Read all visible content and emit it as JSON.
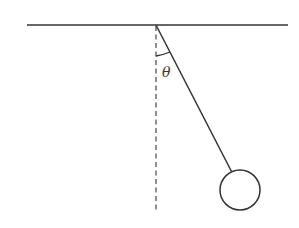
{
  "diagram": {
    "type": "simple-pendulum",
    "angle_label": "θ",
    "colors": {
      "line": "#333333",
      "background": "#ffffff"
    },
    "ceiling": {
      "x1": 27,
      "y": 25,
      "x2": 288
    },
    "pivot": {
      "x": 156,
      "y": 25
    },
    "vertical_reference": {
      "x": 156,
      "y1": 25,
      "y2": 213,
      "style": "dashed"
    },
    "string": {
      "x1": 156,
      "y1": 25,
      "x2": 231,
      "y2": 172
    },
    "bob": {
      "cx": 240,
      "cy": 190,
      "r": 20
    }
  }
}
